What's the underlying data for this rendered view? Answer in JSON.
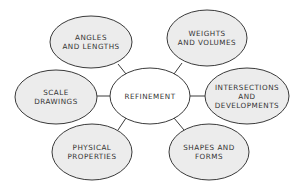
{
  "diagram": {
    "type": "mind-map",
    "center": {
      "id": "refinement",
      "lines": [
        "REFINEMENT"
      ],
      "cx": 150,
      "cy": 96,
      "rx": 40,
      "ry": 28
    },
    "nodes": [
      {
        "id": "angles-and-lengths",
        "lines": [
          "ANGLES",
          "AND LENGTHS"
        ],
        "cx": 91,
        "cy": 42,
        "rx": 41,
        "ry": 26
      },
      {
        "id": "weights-and-volumes",
        "lines": [
          "WEIGHTS",
          "AND VOLUMES"
        ],
        "cx": 207,
        "cy": 38,
        "rx": 40,
        "ry": 28
      },
      {
        "id": "scale-drawings",
        "lines": [
          "SCALE",
          "DRAWINGS"
        ],
        "cx": 56,
        "cy": 97,
        "rx": 41,
        "ry": 27
      },
      {
        "id": "intersections-and-developments",
        "lines": [
          "INTERSECTIONS",
          "AND",
          "DEVELOPMENTS"
        ],
        "cx": 247,
        "cy": 96,
        "rx": 42,
        "ry": 28
      },
      {
        "id": "physical-properties",
        "lines": [
          "PHYSICAL",
          "PROPERTIES"
        ],
        "cx": 92,
        "cy": 152,
        "rx": 40,
        "ry": 28
      },
      {
        "id": "shapes-and-forms",
        "lines": [
          "SHAPES AND",
          "FORMS"
        ],
        "cx": 209,
        "cy": 152,
        "rx": 40,
        "ry": 28
      }
    ],
    "edges": [
      {
        "from": "refinement",
        "to": "angles-and-lengths",
        "x1": 126,
        "y1": 74,
        "x2": 118,
        "y2": 64
      },
      {
        "from": "refinement",
        "to": "weights-and-volumes",
        "x1": 174,
        "y1": 74,
        "x2": 182,
        "y2": 63
      },
      {
        "from": "refinement",
        "to": "scale-drawings",
        "x1": 110,
        "y1": 96,
        "x2": 97,
        "y2": 96
      },
      {
        "from": "refinement",
        "to": "intersections-and-developments",
        "x1": 190,
        "y1": 96,
        "x2": 205,
        "y2": 96
      },
      {
        "from": "refinement",
        "to": "physical-properties",
        "x1": 126,
        "y1": 118,
        "x2": 118,
        "y2": 130
      },
      {
        "from": "refinement",
        "to": "shapes-and-forms",
        "x1": 174,
        "y1": 118,
        "x2": 184,
        "y2": 130
      }
    ]
  }
}
